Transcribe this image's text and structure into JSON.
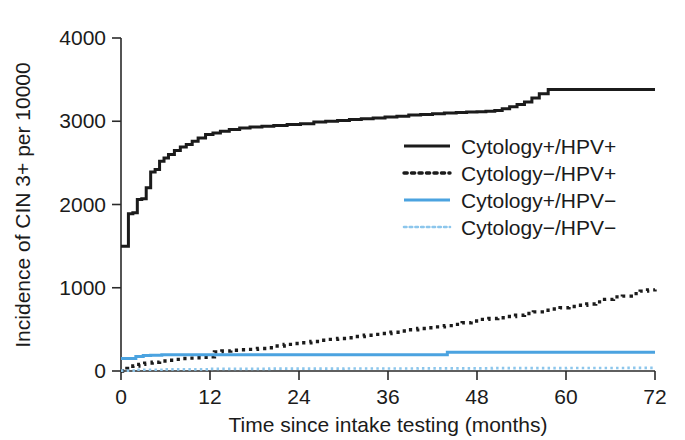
{
  "chart_data": {
    "type": "line",
    "title": "",
    "xlabel": "Time since intake testing (months)",
    "ylabel": "Incidence of CIN 3+ per 10000",
    "xlim": [
      0,
      72
    ],
    "ylim": [
      0,
      4000
    ],
    "xticks": [
      0,
      12,
      24,
      36,
      48,
      60,
      72
    ],
    "yticks": [
      0,
      1000,
      2000,
      3000,
      4000
    ],
    "xtick_labels": [
      "0",
      "12",
      "24",
      "36",
      "48",
      "60",
      "72"
    ],
    "ytick_labels": [
      "0",
      "1000",
      "2000",
      "3000",
      "4000"
    ],
    "grid": false,
    "legend_position": "center-right",
    "step_type": "post",
    "series": [
      {
        "name": "Cytology+/HPV+",
        "color": "#1b1b1b",
        "style": "solid",
        "width": 3.0,
        "x": [
          0,
          0.5,
          1.0,
          1.6,
          2.2,
          2.8,
          3.4,
          4.0,
          4.6,
          5.2,
          5.8,
          6.4,
          7.2,
          8.0,
          8.8,
          9.6,
          10.4,
          11.4,
          12.4,
          13.4,
          14.6,
          16.0,
          17.4,
          19.0,
          20.6,
          22.4,
          24.2,
          26.0,
          27.6,
          29.2,
          30.8,
          32.4,
          34.0,
          35.6,
          37.2,
          38.8,
          40.4,
          42.0,
          43.6,
          45.2,
          46.6,
          48.0,
          49.2,
          50.4,
          51.4,
          52.4,
          53.4,
          54.4,
          55.4,
          56.4,
          57.6,
          72
        ],
        "y": [
          1500,
          1500,
          1890,
          1900,
          2060,
          2070,
          2200,
          2390,
          2420,
          2520,
          2560,
          2600,
          2650,
          2690,
          2720,
          2760,
          2800,
          2840,
          2860,
          2880,
          2900,
          2920,
          2930,
          2940,
          2950,
          2960,
          2970,
          2990,
          3000,
          3010,
          3020,
          3030,
          3040,
          3050,
          3060,
          3075,
          3080,
          3090,
          3100,
          3105,
          3110,
          3115,
          3120,
          3130,
          3150,
          3175,
          3200,
          3230,
          3280,
          3330,
          3380,
          3380
        ]
      },
      {
        "name": "Cytology−/HPV+",
        "color": "#1b1b1b",
        "style": "dotted",
        "width": 3.4,
        "x": [
          0,
          0.8,
          1.6,
          2.4,
          3.2,
          4.2,
          5.2,
          6.2,
          7.2,
          8.2,
          9.2,
          10.2,
          11.2,
          12.0,
          12.6,
          13.6,
          14.8,
          16.0,
          17.2,
          18.4,
          19.6,
          20.8,
          22.0,
          23.2,
          24.4,
          25.6,
          26.8,
          28.0,
          29.2,
          30.4,
          31.6,
          32.8,
          34.0,
          35.2,
          36.4,
          37.6,
          38.8,
          40.0,
          41.2,
          42.4,
          43.6,
          44.8,
          46.0,
          47.2,
          48.4,
          49.6,
          50.8,
          52.0,
          53.2,
          54.4,
          55.6,
          56.8,
          58.0,
          59.2,
          60.4,
          61.6,
          62.8,
          64.0,
          65.2,
          66.4,
          67.6,
          68.8,
          70.0,
          71.0,
          72.0
        ],
        "y": [
          0,
          30,
          60,
          80,
          95,
          105,
          120,
          130,
          140,
          150,
          155,
          160,
          165,
          170,
          230,
          240,
          250,
          255,
          260,
          270,
          280,
          300,
          320,
          330,
          340,
          355,
          370,
          380,
          390,
          400,
          415,
          430,
          440,
          450,
          465,
          480,
          495,
          510,
          520,
          530,
          545,
          560,
          580,
          600,
          620,
          630,
          640,
          655,
          670,
          690,
          710,
          730,
          745,
          760,
          775,
          790,
          805,
          830,
          860,
          890,
          900,
          930,
          960,
          975,
          980
        ]
      },
      {
        "name": "Cytology+/HPV−",
        "color": "#4BA3E0",
        "style": "solid",
        "width": 3.0,
        "x": [
          0,
          1.0,
          2.0,
          3.0,
          4.0,
          5.5,
          20.0,
          43.5,
          44.0,
          72
        ],
        "y": [
          150,
          150,
          175,
          185,
          190,
          195,
          195,
          195,
          225,
          225
        ]
      },
      {
        "name": "Cytology−/HPV−",
        "color": "#8CC6EC",
        "style": "dotted",
        "width": 2.6,
        "x": [
          0,
          2,
          6,
          12,
          20,
          30,
          40,
          50,
          60,
          68,
          72
        ],
        "y": [
          5,
          15,
          20,
          25,
          28,
          30,
          32,
          34,
          36,
          38,
          40
        ]
      }
    ]
  },
  "legend": {
    "entries": [
      {
        "label": "Cytology+/HPV+"
      },
      {
        "label": "Cytology−/HPV+"
      },
      {
        "label": "Cytology+/HPV−"
      },
      {
        "label": "Cytology−/HPV−"
      }
    ]
  }
}
